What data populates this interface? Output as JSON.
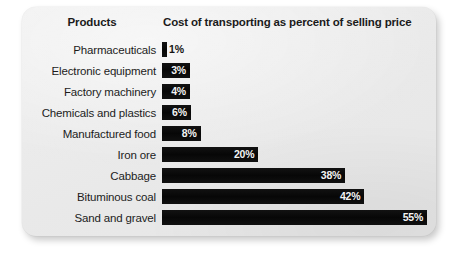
{
  "card": {
    "background_color": "#ececec",
    "bar_color": "#0b0b0b"
  },
  "header": {
    "products_label": "Products",
    "cost_label": "Cost of transporting as percent of selling price"
  },
  "chart_data": {
    "type": "bar",
    "orientation": "horizontal",
    "title": "Cost of transporting as percent of selling price",
    "xlabel": "Cost of transporting as percent of selling price",
    "ylabel": "Products",
    "grid": false,
    "legend": null,
    "xlim": [
      0,
      55
    ],
    "categories": [
      "Pharmaceuticals",
      "Electronic equipment",
      "Factory machinery",
      "Chemicals and plastics",
      "Manufactured food",
      "Iron ore",
      "Cabbage",
      "Bituminous coal",
      "Sand and gravel"
    ],
    "values": [
      1,
      3,
      4,
      6,
      8,
      20,
      38,
      42,
      55
    ],
    "value_labels": [
      "1%",
      "3%",
      "4%",
      "6%",
      "8%",
      "20%",
      "38%",
      "42%",
      "55%"
    ],
    "rows": [
      {
        "label": "Pharmaceuticals",
        "value": 1,
        "value_label": "1%",
        "label_position": "outside"
      },
      {
        "label": "Electronic equipment",
        "value": 3,
        "value_label": "3%",
        "label_position": "inside"
      },
      {
        "label": "Factory machinery",
        "value": 4,
        "value_label": "4%",
        "label_position": "inside"
      },
      {
        "label": "Chemicals and plastics",
        "value": 6,
        "value_label": "6%",
        "label_position": "inside"
      },
      {
        "label": "Manufactured food",
        "value": 8,
        "value_label": "8%",
        "label_position": "inside"
      },
      {
        "label": "Iron ore",
        "value": 20,
        "value_label": "20%",
        "label_position": "inside"
      },
      {
        "label": "Cabbage",
        "value": 38,
        "value_label": "38%",
        "label_position": "inside"
      },
      {
        "label": "Bituminous coal",
        "value": 42,
        "value_label": "42%",
        "label_position": "inside"
      },
      {
        "label": "Sand and gravel",
        "value": 55,
        "value_label": "55%",
        "label_position": "inside"
      }
    ]
  }
}
